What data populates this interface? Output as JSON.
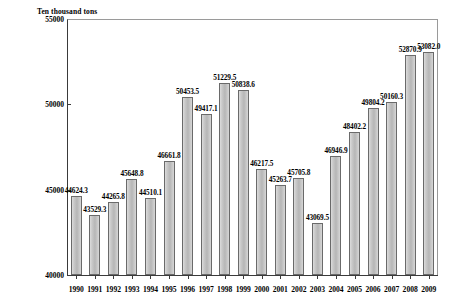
{
  "chart_data": {
    "type": "bar",
    "title": "",
    "ylabel": "Ten thousand tons",
    "xlabel": "",
    "ylim": [
      40000,
      55000
    ],
    "yticks": [
      40000,
      45000,
      50000,
      55000
    ],
    "grid": false,
    "legend": "none",
    "categories": [
      "1990",
      "1991",
      "1992",
      "1993",
      "1994",
      "1995",
      "1996",
      "1997",
      "1998",
      "1999",
      "2000",
      "2001",
      "2002",
      "2003",
      "2004",
      "2005",
      "2006",
      "2007",
      "2008",
      "2009"
    ],
    "values": [
      44624.3,
      43529.3,
      44265.8,
      45648.8,
      44510.1,
      46661.8,
      50453.5,
      49417.1,
      51229.5,
      50838.6,
      46217.5,
      45263.7,
      45705.8,
      43069.5,
      46946.9,
      48402.2,
      49804.2,
      50160.3,
      52870.9,
      53082.0
    ],
    "value_labels": [
      "44624.3",
      "43529.3",
      "44265.8",
      "45648.8",
      "44510.1",
      "46661.8",
      "50453.5",
      "49417.1",
      "51229.5",
      "50838.6",
      "46217.5",
      "45263.7",
      "45705.8",
      "43069.5",
      "46946.9",
      "48402.2",
      "49804.2",
      "50160.3",
      "52870.9",
      "53082.0"
    ],
    "ytick_labels": [
      "40000",
      "45000",
      "50000",
      "55000"
    ]
  }
}
